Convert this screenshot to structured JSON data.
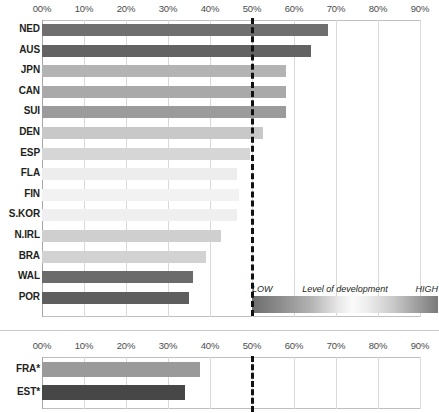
{
  "chart_data": {
    "type": "bar",
    "title": "",
    "subtitle": "",
    "xlabel": "",
    "ylabel": "",
    "orientation": "horizontal",
    "xlim": [
      0,
      90
    ],
    "xtick_labels": [
      "00%",
      "10%",
      "20%",
      "30%",
      "40%",
      "50%",
      "60%",
      "70%",
      "80%",
      "90%"
    ],
    "xtick_values": [
      0,
      10,
      20,
      30,
      40,
      50,
      60,
      70,
      80,
      90
    ],
    "grid": true,
    "reference_line": {
      "value": 50,
      "label": "50%",
      "style": "dashed",
      "color": "#111111"
    },
    "legend": {
      "position": "inside-lower-right",
      "type": "gradient",
      "title": "Level of development",
      "low_label": "LOW",
      "high_label": "HIGH"
    },
    "categories": [
      "NED",
      "AUS",
      "JPN",
      "CAN",
      "SUI",
      "DEN",
      "ESP",
      "FLA",
      "FIN",
      "S.KOR",
      "N.IRL",
      "BRA",
      "WAL",
      "POR"
    ],
    "values": [
      68,
      64,
      58,
      58,
      58,
      52.5,
      49.5,
      46.5,
      47,
      46.5,
      42.5,
      39,
      36,
      35
    ],
    "bar_colors": [
      "#6f6f6f",
      "#636363",
      "#b3b3b3",
      "#a9a9a9",
      "#9b9b9b",
      "#c8c8c8",
      "#d6d6d6",
      "#ededed",
      "#f2f2f2",
      "#efefef",
      "#cfcfcf",
      "#d2d2d2",
      "#6b6b6b",
      "#5e5e5e"
    ],
    "secondary_panel": {
      "xtick_labels": [
        "00%",
        "10%",
        "20%",
        "30%",
        "40%",
        "50%",
        "60%",
        "70%",
        "80%",
        "90%"
      ],
      "xtick_values": [
        0,
        10,
        20,
        30,
        40,
        50,
        60,
        70,
        80,
        90
      ],
      "categories": [
        "FRA*",
        "EST*"
      ],
      "values": [
        37.5,
        34
      ],
      "bar_colors": [
        "#9a9a9a",
        "#474747"
      ],
      "reference_line": {
        "value": 50,
        "style": "dashed",
        "color": "#111111"
      }
    }
  }
}
